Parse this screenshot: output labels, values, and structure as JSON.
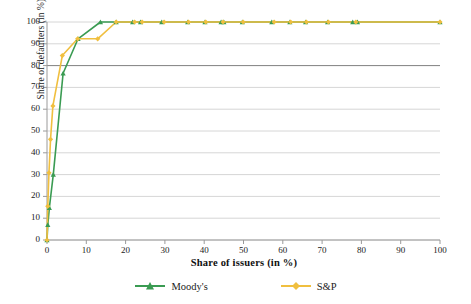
{
  "chart_data": {
    "type": "line",
    "title": "",
    "xlabel": "Share of issuers (in %)",
    "ylabel": "Share of defaulters (in %)",
    "xlim": [
      0,
      100
    ],
    "ylim": [
      0,
      100
    ],
    "xticks": [
      0,
      10,
      20,
      30,
      40,
      50,
      60,
      70,
      80,
      90,
      100
    ],
    "yticks": [
      0,
      10,
      20,
      30,
      40,
      50,
      60,
      70,
      80,
      90,
      100
    ],
    "grid": "horizontal",
    "legend_position": "bottom",
    "series": [
      {
        "name": "Moody's",
        "color": "#3a9b52",
        "marker": "triangle",
        "points": [
          [
            0.0,
            0.0
          ],
          [
            0.2,
            7.0
          ],
          [
            0.6,
            14.8
          ],
          [
            1.6,
            30.0
          ],
          [
            4.1,
            76.5
          ],
          [
            7.9,
            92.3
          ],
          [
            13.6,
            100.0
          ],
          [
            17.6,
            100.0
          ],
          [
            21.8,
            100.0
          ],
          [
            23.8,
            100.0
          ],
          [
            29.2,
            100.0
          ],
          [
            35.8,
            100.0
          ],
          [
            40.2,
            100.0
          ],
          [
            44.3,
            100.0
          ],
          [
            45.0,
            100.0
          ],
          [
            49.7,
            100.0
          ],
          [
            57.2,
            100.0
          ],
          [
            61.8,
            100.0
          ],
          [
            65.8,
            100.0
          ],
          [
            71.4,
            100.0
          ],
          [
            77.8,
            100.0
          ],
          [
            79.0,
            100.0
          ],
          [
            100.0,
            100.0
          ]
        ]
      },
      {
        "name": "S&P",
        "color": "#f0bf3f",
        "marker": "diamond",
        "points": [
          [
            0.0,
            0.0
          ],
          [
            0.2,
            15.5
          ],
          [
            0.5,
            30.8
          ],
          [
            0.9,
            46.2
          ],
          [
            1.5,
            61.5
          ],
          [
            3.9,
            84.6
          ],
          [
            7.8,
            92.3
          ],
          [
            12.9,
            92.3
          ],
          [
            17.6,
            100.0
          ],
          [
            22.3,
            100.0
          ],
          [
            24.2,
            100.0
          ],
          [
            29.8,
            100.0
          ],
          [
            36.0,
            100.0
          ],
          [
            40.4,
            100.0
          ],
          [
            44.8,
            100.0
          ],
          [
            49.9,
            100.0
          ],
          [
            57.8,
            100.0
          ],
          [
            62.0,
            100.0
          ],
          [
            66.0,
            100.0
          ],
          [
            71.6,
            100.0
          ],
          [
            78.6,
            100.0
          ],
          [
            100.0,
            100.0
          ]
        ]
      }
    ]
  },
  "legend": {
    "items": [
      {
        "label": "Moody's"
      },
      {
        "label": "S&P"
      }
    ]
  },
  "colors": {
    "moodys": "#3a9b52",
    "sp": "#f0bf3f",
    "grid": "#d6d6d6",
    "grid_emphasis": "#808080",
    "axis": "#9a9a9a",
    "text": "#1a1a1a"
  }
}
